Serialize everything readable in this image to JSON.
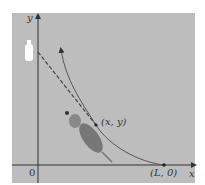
{
  "figure": {
    "axis_labels": {
      "x": "x",
      "y": "y",
      "origin": "0"
    },
    "points": {
      "current": "(x, y)",
      "start": "(L, 0)"
    },
    "icons": [
      "bottle-icon",
      "dog-icon"
    ],
    "colors": {
      "background": "#bdbdbd",
      "curve": "#555555",
      "dog": "#777777",
      "bottle": "#ffffff"
    }
  }
}
